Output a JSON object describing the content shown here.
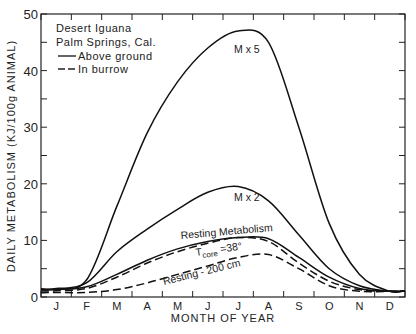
{
  "chart_data": {
    "type": "line",
    "title": "",
    "xlabel": "MONTH OF YEAR",
    "ylabel": "DAILY METABOLISM (KJ/100g ANIMAL)",
    "ylim": [
      0,
      50
    ],
    "yticks": [
      0,
      10,
      20,
      30,
      40,
      50
    ],
    "categories": [
      "J",
      "F",
      "M",
      "A",
      "M",
      "J",
      "J",
      "A",
      "S",
      "O",
      "N",
      "D"
    ],
    "grid": false,
    "legend": {
      "position": "upper-left",
      "title_lines": [
        "Desert Iguana",
        "Palm Springs, Cal."
      ],
      "entries": [
        {
          "label": "Above ground",
          "style": "solid"
        },
        {
          "label": "In burrow",
          "style": "dashed"
        }
      ]
    },
    "series": [
      {
        "name": "M x 5",
        "style": "solid",
        "values": [
          1.5,
          3,
          16,
          29,
          38,
          44,
          47,
          45,
          30,
          13,
          4,
          1
        ]
      },
      {
        "name": "M x 2",
        "style": "solid",
        "values": [
          1.4,
          2.5,
          8,
          12,
          15.5,
          18.5,
          19.5,
          17,
          11,
          5,
          2,
          1
        ]
      },
      {
        "name": "Resting Metabolism",
        "style": "solid",
        "values": [
          1.3,
          1.8,
          4,
          6.5,
          8.5,
          9.8,
          10.5,
          10.3,
          7,
          3.5,
          1.5,
          1
        ]
      },
      {
        "name": "Tcore = 38°",
        "style": "dashed",
        "values": [
          1.1,
          1.5,
          3.5,
          6,
          8,
          9.5,
          10.5,
          9.8,
          6,
          2.8,
          1.3,
          1
        ]
      },
      {
        "name": "Resting - 200 cm",
        "style": "dashed",
        "values": [
          0.8,
          0.8,
          1.3,
          2.5,
          4,
          5.5,
          7,
          7.5,
          5,
          2,
          1,
          1
        ]
      }
    ],
    "annotations": [
      "M x 5",
      "M x 2",
      "Resting Metabolism",
      "Tcore = 38°",
      "Resting - 200 cm"
    ]
  },
  "labels": {
    "y_axis": "DAILY METABOLISM (KJ/100g ANIMAL)",
    "x_axis": "MONTH OF YEAR",
    "legend_title_1": "Desert Iguana",
    "legend_title_2": "Palm Springs, Cal.",
    "legend_solid": "Above ground",
    "legend_dashed": "In burrow",
    "ann_mx5": "M x 5",
    "ann_mx2": "M x 2",
    "ann_resting": "Resting Metabolism",
    "ann_tcore_t": "T",
    "ann_tcore_sub": "core",
    "ann_tcore_val": " =38°",
    "ann_200cm": "Resting - 200 cm"
  },
  "y_tick_labels": [
    "0",
    "10",
    "20",
    "30",
    "40",
    "50"
  ],
  "months": [
    "J",
    "F",
    "M",
    "A",
    "M",
    "J",
    "J",
    "A",
    "S",
    "O",
    "N",
    "D"
  ]
}
